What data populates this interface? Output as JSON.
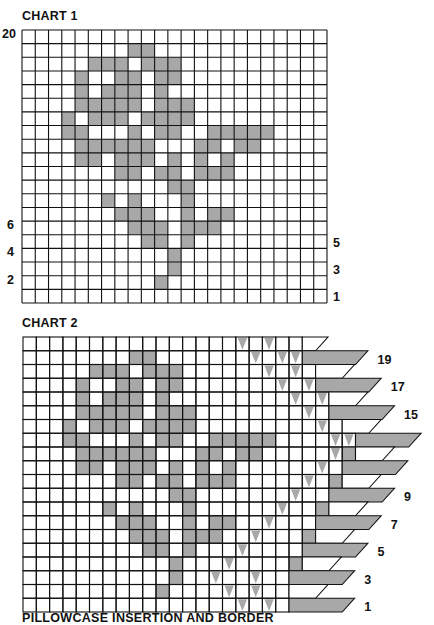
{
  "chart1": {
    "title": "CHART 1",
    "cols": 23,
    "rows": 20,
    "left_labels": [
      {
        "text": "20",
        "row": 0
      },
      {
        "text": "6",
        "row": 14
      },
      {
        "text": "4",
        "row": 16
      },
      {
        "text": "2",
        "row": 18
      }
    ],
    "right_labels": [
      {
        "text": "5",
        "row": 15
      },
      {
        "text": "3",
        "row": 17
      },
      {
        "text": "1",
        "row": 19
      }
    ]
  },
  "chart2": {
    "title": "CHART 2",
    "rows": 20,
    "border_labels": [
      {
        "text": "19",
        "row": 1
      },
      {
        "text": "17",
        "row": 3
      },
      {
        "text": "15",
        "row": 5
      },
      {
        "text": "9",
        "row": 11
      },
      {
        "text": "7",
        "row": 13
      },
      {
        "text": "5",
        "row": 15
      },
      {
        "text": "3",
        "row": 17
      },
      {
        "text": "1",
        "row": 19
      }
    ],
    "edge_rows": [
      {
        "end": 21,
        "tri": [
          16,
          18
        ],
        "band": "white",
        "bandLen": 1
      },
      {
        "end": 21,
        "tri": [
          17,
          19,
          20
        ],
        "band": "gray",
        "bandLen": 4
      },
      {
        "end": 22,
        "tri": [
          18,
          20
        ],
        "band": "white",
        "bandLen": 2
      },
      {
        "end": 22,
        "tri": [
          19,
          21
        ],
        "gray": [],
        "band": "gray",
        "bandLen": 4
      },
      {
        "end": 23,
        "tri": [
          20,
          22
        ],
        "band": "white",
        "bandLen": 2
      },
      {
        "end": 23,
        "tri": [
          21,
          23
        ],
        "band": "gray",
        "bandLen": 4
      },
      {
        "end": 24,
        "tri": [
          22,
          24
        ],
        "band": "white",
        "bandLen": 2
      },
      {
        "end": 25,
        "tri": [
          23,
          24
        ],
        "gray": [],
        "band": "gray",
        "bandLen": 4
      },
      {
        "end": 25,
        "tri": [
          23
        ],
        "gray": [
          24
        ],
        "band": "white",
        "bandLen": 2
      },
      {
        "end": 24,
        "tri": [
          22
        ],
        "band": "gray",
        "bandLen": 4
      },
      {
        "end": 24,
        "tri": [
          21
        ],
        "gray": [
          23
        ],
        "band": "white",
        "bandLen": 2
      },
      {
        "end": 23,
        "tri": [
          20
        ],
        "band": "gray",
        "bandLen": 4
      },
      {
        "end": 23,
        "tri": [
          19
        ],
        "gray": [
          22
        ],
        "band": "white",
        "bandLen": 2
      },
      {
        "end": 22,
        "tri": [
          18
        ],
        "band": "gray",
        "bandLen": 4
      },
      {
        "end": 22,
        "tri": [
          17
        ],
        "gray": [
          21
        ],
        "band": "white",
        "bandLen": 2
      },
      {
        "end": 21,
        "tri": [
          16
        ],
        "band": "gray",
        "bandLen": 4
      },
      {
        "end": 21,
        "tri": [
          15
        ],
        "gray": [
          20
        ],
        "band": "white",
        "bandLen": 2
      },
      {
        "end": 20,
        "tri": [
          14,
          17
        ],
        "band": "gray",
        "bandLen": 4
      },
      {
        "end": 20,
        "tri": [
          15,
          17
        ],
        "band": "white",
        "bandLen": 2
      },
      {
        "end": 20,
        "tri": [
          16,
          18
        ],
        "band": "gray",
        "bandLen": 4
      }
    ]
  },
  "motif_rows": [
    [],
    [
      8,
      9
    ],
    [
      5,
      6,
      7,
      9,
      10,
      11
    ],
    [
      4,
      7,
      8,
      10,
      11
    ],
    [
      4,
      6,
      7,
      8,
      10
    ],
    [
      4,
      5,
      6,
      7,
      8,
      10,
      11,
      12
    ],
    [
      3,
      5,
      6,
      7,
      9,
      10,
      11,
      12
    ],
    [
      3,
      4,
      8,
      10,
      11,
      14,
      15,
      16,
      17,
      18
    ],
    [
      4,
      5,
      6,
      7,
      8,
      9,
      13,
      14,
      16,
      17
    ],
    [
      4,
      5,
      7,
      8,
      9,
      11,
      13,
      15
    ],
    [
      7,
      8,
      10,
      11,
      13,
      14,
      15
    ],
    [
      11,
      12
    ],
    [
      6,
      8,
      12
    ],
    [
      7,
      8,
      9,
      12,
      14,
      15
    ],
    [
      8,
      9,
      10,
      12,
      13,
      14
    ],
    [
      9,
      10,
      12
    ],
    [
      11
    ],
    [
      11
    ],
    [
      10
    ],
    []
  ],
  "colors": {
    "fill": "#a8a8a8",
    "line": "#111111",
    "background": "#ffffff"
  },
  "caption": "PILLOWCASE INSERTION AND BORDER"
}
